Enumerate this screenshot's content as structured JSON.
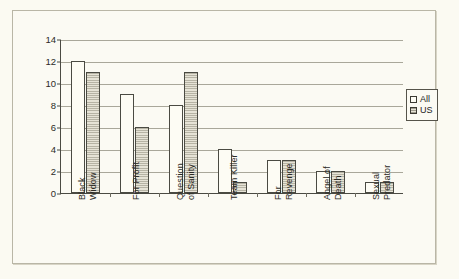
{
  "chart_data": {
    "type": "bar",
    "title": "",
    "subtitle": "",
    "xlabel": "",
    "ylabel": "",
    "ylim": [
      0,
      14
    ],
    "ytick_values": [
      0,
      2,
      4,
      6,
      8,
      10,
      12,
      14
    ],
    "ytick_labels": [
      "0",
      "2",
      "4",
      "6",
      "8",
      "10",
      "12",
      "14"
    ],
    "grid": true,
    "grid_axis": "y",
    "legend_position": "right",
    "categories": [
      "Black\nWidow",
      "For Profit",
      "Question\nof Sanity",
      "Team Killer",
      "For\nRevenge",
      "Angel of\nDeath",
      "Sexual\nPredator"
    ],
    "series": [
      {
        "name": "All",
        "values": [
          12,
          9,
          8,
          4,
          3,
          2,
          1
        ],
        "color": "#fdfcf4",
        "pattern": "solid"
      },
      {
        "name": "US",
        "values": [
          11,
          6,
          11,
          1,
          3,
          2,
          1
        ],
        "color": "#cfccbe",
        "pattern": "horizontal-hatch"
      }
    ],
    "annotations": []
  },
  "legend": {
    "items": [
      {
        "label": "All",
        "swatch": "legend-swatch-all"
      },
      {
        "label": "US",
        "swatch": "legend-swatch-us"
      }
    ]
  },
  "colors": {
    "background": "#fbfaf2",
    "plot_background": "#fbfaf3",
    "axis": "#4a4a42",
    "gridline": "#a9a79a",
    "frame_border": "#b9b6a6",
    "text": "#2b2b26"
  }
}
